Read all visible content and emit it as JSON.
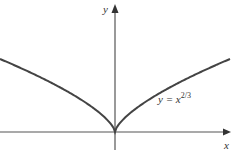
{
  "chart_data": {
    "type": "line",
    "title": "",
    "xlabel": "x",
    "ylabel": "y",
    "annotations": [
      {
        "text": "y = x",
        "superscript": "2/3",
        "position": "right of y-axis, below curve"
      }
    ],
    "series": [
      {
        "name": "y = x^(2/3)",
        "function": "x^(2/3)",
        "x_range": [
          -8,
          8
        ]
      }
    ],
    "xlim": [
      -8,
      8
    ],
    "ylim": [
      0,
      4
    ],
    "grid": false,
    "legend": "none",
    "ticks": "none"
  },
  "labels": {
    "x_axis": "x",
    "y_axis": "y",
    "curve_base": "y = x",
    "curve_exp": "2/3"
  },
  "colors": {
    "curve": "#444444",
    "axis": "#555555",
    "text": "#333333"
  }
}
